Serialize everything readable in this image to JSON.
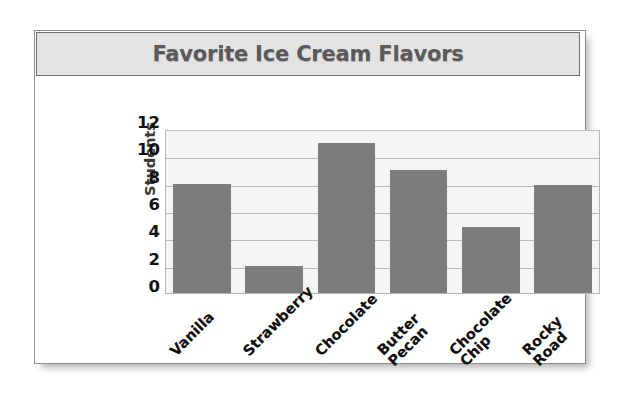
{
  "chart_data": {
    "type": "bar",
    "title": "Favorite Ice Cream Flavors",
    "xlabel": "",
    "ylabel": "Students",
    "categories": [
      "Vanilla",
      "Strawberry",
      "Chocolate",
      "Butter Pecan",
      "Chocolate Chip",
      "Rocky Road"
    ],
    "category_lines": [
      [
        "Vanilla"
      ],
      [
        "Strawberry"
      ],
      [
        "Chocolate"
      ],
      [
        "Butter",
        "Pecan"
      ],
      [
        "Chocolate",
        "Chip"
      ],
      [
        "Rocky",
        "Road"
      ]
    ],
    "values": [
      8,
      2,
      11,
      9,
      4.8,
      7.9
    ],
    "ylim": [
      0,
      12
    ],
    "yticks": [
      12,
      10,
      8,
      6,
      4,
      2,
      0
    ],
    "grid": true,
    "legend": false,
    "bar_color": "#7c7c7c",
    "plot_background": "#f5f5f3",
    "gridline_color": "#b9b9b9",
    "title_color": "#5a5a5a",
    "title_banner_color": "#e3e3e3"
  }
}
